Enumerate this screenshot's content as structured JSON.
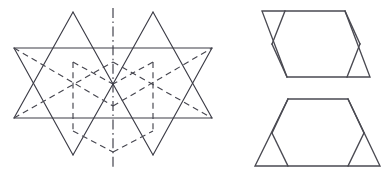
{
  "figure": {
    "background_color": "#ffffff",
    "width": 389,
    "height": 176,
    "line_colors": {
      "solid": "#3c3c46",
      "hidden": "#46464f",
      "axis": "#3c3c46",
      "net": "#4a4a52"
    }
  },
  "left_figure": {
    "name": "interpenetrant-twin-star",
    "description": "Two interpenetrating sets of triangles forming a star outline, with hidden (dashed) internal edges and a vertical dash-dot symmetry axis",
    "bounds": {
      "x": 12,
      "y": 8,
      "width": 202,
      "height": 160
    },
    "solid_polylines": [
      {
        "id": "upper-horizontal-edge",
        "points": "14,48 212,48"
      },
      {
        "id": "lower-horizontal-edge",
        "points": "14,118 212,118"
      },
      {
        "id": "left-triangle-up-left-leg",
        "points": "14,118 73,12"
      },
      {
        "id": "left-triangle-up-right-leg",
        "points": "73,12 113,84"
      },
      {
        "id": "left-triangle-down-leg",
        "points": "113,84 73,155"
      },
      {
        "id": "left-triangle-down-left-leg",
        "points": "73,155 14,48"
      },
      {
        "id": "right-triangle-up-left-leg",
        "points": "113,84 153,12"
      },
      {
        "id": "right-triangle-up-right-leg",
        "points": "153,12 212,118"
      },
      {
        "id": "right-triangle-down-right-leg",
        "points": "212,48 153,155"
      },
      {
        "id": "right-triangle-down-left-leg",
        "points": "153,155 113,84"
      }
    ],
    "hidden_polylines": [
      {
        "id": "hidden-upper-left-diagonal",
        "points": "14,118 113,62"
      },
      {
        "id": "hidden-upper-right-diagonal",
        "points": "113,62 212,118"
      },
      {
        "id": "hidden-lower-left-diagonal",
        "points": "14,48 113,106"
      },
      {
        "id": "hidden-lower-right-diagonal",
        "points": "113,106 212,48"
      },
      {
        "id": "hidden-left-vertical",
        "points": "73,62 73,131"
      },
      {
        "id": "hidden-right-vertical",
        "points": "153,62 153,131"
      },
      {
        "id": "hidden-bottom-left-edge",
        "points": "73,131 113,152"
      },
      {
        "id": "hidden-bottom-right-edge",
        "points": "113,152 153,131"
      },
      {
        "id": "hidden-left-inner-short",
        "points": "73,62 113,84"
      },
      {
        "id": "hidden-right-inner-short",
        "points": "153,62 113,84"
      }
    ],
    "axis_lines": [
      {
        "id": "vertical-symmetry-axis",
        "points": "113,8 113,168"
      }
    ]
  },
  "top_right_figure": {
    "name": "rhombus-net",
    "description": "Parallelogram outline containing an inscribed hexagon, leaving one small triangle at the upper-left and one at the lower-right",
    "bounds": {
      "x": 262,
      "y": 11,
      "width": 108,
      "height": 68
    },
    "polylines": [
      {
        "id": "rhombus-outline",
        "points": "262,11 345,11 370,77 287,77 262,11",
        "closed": true
      },
      {
        "id": "hexagon-upper-left-cut",
        "points": "285,11 272,44"
      },
      {
        "id": "hexagon-left-edge",
        "points": "272,44 287,77"
      },
      {
        "id": "hexagon-lower-right-cut",
        "points": "347,77 360,44"
      },
      {
        "id": "hexagon-right-edge",
        "points": "360,44 345,11"
      }
    ]
  },
  "bottom_right_figure": {
    "name": "trapezoid-net",
    "description": "Trapezoid outline containing an inscribed hexagon, leaving a small triangle at each lower corner",
    "bounds": {
      "x": 255,
      "y": 99,
      "width": 125,
      "height": 67
    },
    "polylines": [
      {
        "id": "trapezoid-outline",
        "points": "288,99 348,99 380,166 255,166 288,99",
        "closed": true
      },
      {
        "id": "hexagon-left-cut",
        "points": "272,133 288,166"
      },
      {
        "id": "hexagon-left-edge",
        "points": "288,99 272,133"
      },
      {
        "id": "hexagon-right-cut",
        "points": "364,133 348,166"
      },
      {
        "id": "hexagon-right-edge",
        "points": "348,99 364,133"
      }
    ]
  }
}
